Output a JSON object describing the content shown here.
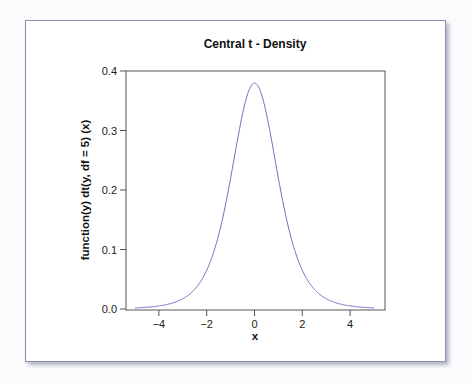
{
  "chart_data": {
    "type": "line",
    "title": "Central t - Density",
    "xlabel": "x",
    "ylabel": "function(y) dt(y, df = 5) (x)",
    "df": 5,
    "xlim": [
      -5,
      5
    ],
    "ylim": [
      0.0,
      0.4
    ],
    "xticks": [
      -4,
      -2,
      0,
      2,
      4
    ],
    "xtick_labels": [
      "−4",
      "−2",
      "0",
      "2",
      "4"
    ],
    "yticks": [
      0.0,
      0.1,
      0.2,
      0.3,
      0.4
    ],
    "ytick_labels": [
      "0.0",
      "0.1",
      "0.2",
      "0.3",
      "0.4"
    ],
    "grid": false,
    "legend": null,
    "series": [
      {
        "name": "t density (df = 5)",
        "color": "#6b6fc0",
        "x": [
          -5,
          -4.5,
          -4,
          -3.5,
          -3,
          -2.5,
          -2,
          -1.5,
          -1,
          -0.5,
          0,
          0.5,
          1,
          1.5,
          2,
          2.5,
          3,
          3.5,
          4,
          4.5,
          5
        ],
        "y": [
          0.0018,
          0.0029,
          0.0051,
          0.0093,
          0.0173,
          0.0332,
          0.0651,
          0.1245,
          0.2197,
          0.3279,
          0.3796,
          0.3279,
          0.2197,
          0.1245,
          0.0651,
          0.0332,
          0.0173,
          0.0093,
          0.0051,
          0.0029,
          0.0018
        ]
      }
    ]
  }
}
